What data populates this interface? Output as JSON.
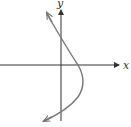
{
  "diagram": {
    "type": "graph-sketch",
    "axes": {
      "x_label": "x",
      "y_label": "y",
      "axis_color": "#333333"
    },
    "curve": {
      "color": "#777777",
      "shape": "parabola opening left",
      "arrows": "both ends"
    }
  }
}
